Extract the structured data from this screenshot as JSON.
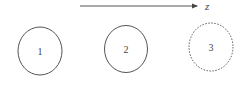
{
  "diagram": {
    "type": "particle-sequence",
    "stroke_color": "#555555",
    "axis": {
      "label": "z",
      "x1": 80,
      "y": 6,
      "x2": 197,
      "label_x": 205,
      "label_y": 10
    },
    "nodes": [
      {
        "id": "1",
        "label": "1",
        "cx": 40,
        "cy": 51,
        "rx": 22,
        "ry": 24,
        "style": "solid"
      },
      {
        "id": "2",
        "label": "2",
        "cx": 126,
        "cy": 49,
        "rx": 21.5,
        "ry": 23.5,
        "style": "solid"
      },
      {
        "id": "3",
        "label": "3",
        "cx": 211,
        "cy": 47,
        "rx": 22,
        "ry": 24,
        "style": "dotted"
      }
    ]
  }
}
